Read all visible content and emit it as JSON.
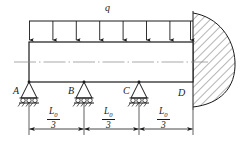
{
  "figure": {
    "type": "structural-beam-diagram",
    "line_color": "#1a1a1a",
    "hatch_color": "#4d4d4d"
  },
  "load": {
    "label": "q",
    "kind": "uniformly-distributed-load",
    "direction": "down",
    "arrow_count": 8
  },
  "nodes": [
    {
      "id": "A",
      "label": "A",
      "support": "roller"
    },
    {
      "id": "B",
      "label": "B",
      "support": "roller"
    },
    {
      "id": "C",
      "label": "C",
      "support": "roller"
    },
    {
      "id": "D",
      "label": "D",
      "support": "fixed-wall"
    }
  ],
  "dimensions": [
    {
      "numerator": "L",
      "subscript": "0",
      "denominator": "3",
      "span": "A-B"
    },
    {
      "numerator": "L",
      "subscript": "0",
      "denominator": "3",
      "span": "B-C"
    },
    {
      "numerator": "L",
      "subscript": "0",
      "denominator": "3",
      "span": "C-D"
    }
  ]
}
